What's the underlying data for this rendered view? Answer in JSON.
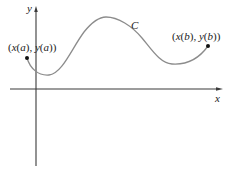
{
  "diagram": {
    "type": "parametric-curve",
    "axes": {
      "x_label": "x",
      "y_label": "y"
    },
    "curve": {
      "label": "C",
      "color": "#8c8c8c"
    },
    "points": {
      "start": {
        "label": "(x(a), y(a))",
        "x_part": "x",
        "a": "a",
        "y_part": "y"
      },
      "end": {
        "label": "(x(b), y(b))",
        "x_part": "x",
        "b": "b",
        "y_part": "y"
      }
    },
    "colors": {
      "axis": "#3a3a3a",
      "curve": "#8c8c8c",
      "point": "#111111",
      "text": "#222222"
    }
  }
}
